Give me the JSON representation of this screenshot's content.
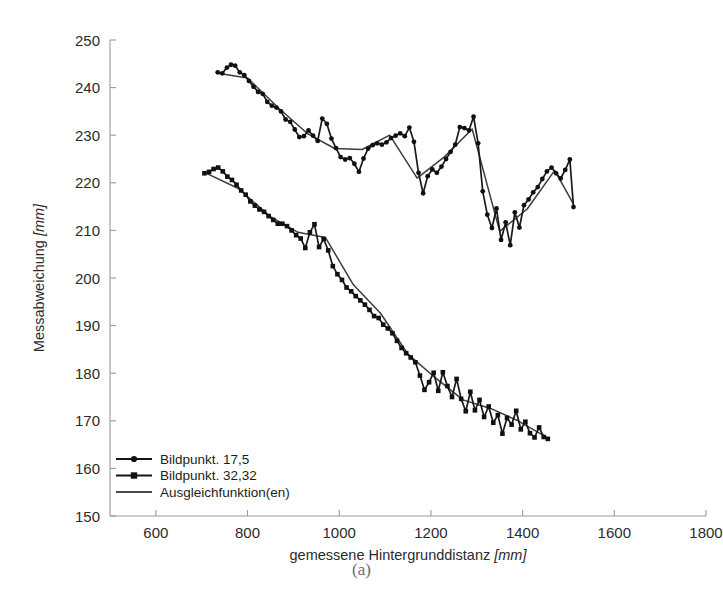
{
  "figure": {
    "caption": "(a)"
  },
  "chart_data": {
    "type": "line",
    "title": "",
    "xlabel_text": "gemessene Hintergrunddistanz ",
    "xlabel_unit": "[mm]",
    "ylabel_text": "Messabweichung ",
    "ylabel_unit": "[mm]",
    "xlim": [
      500,
      1800
    ],
    "ylim": [
      150,
      250
    ],
    "xticks": [
      600,
      800,
      1000,
      1200,
      1400,
      1600,
      1800
    ],
    "xticklabels": [
      "600",
      "800",
      "1000",
      "1200",
      "1400",
      "1600",
      "1800"
    ],
    "yticks": [
      150,
      160,
      170,
      180,
      190,
      200,
      210,
      220,
      230,
      240,
      250
    ],
    "yticklabels": [
      "150",
      "160",
      "170",
      "180",
      "190",
      "200",
      "210",
      "220",
      "230",
      "240",
      "250"
    ],
    "grid": false,
    "legend_position": "lower left",
    "legend": [
      {
        "label": "Bildpunkt. 17,5",
        "marker": "circle",
        "color": "#101010"
      },
      {
        "label": "Bildpunkt. 32,32",
        "marker": "square",
        "color": "#101010"
      },
      {
        "label": "Ausgleichfunktion(en)",
        "marker": "none",
        "color": "#4a4a4a"
      }
    ],
    "series": [
      {
        "name": "Bildpunkt. 17,5",
        "marker": "circle",
        "x": [
          735,
          745,
          755,
          764,
          773,
          783,
          793,
          803,
          813,
          823,
          833,
          843,
          853,
          863,
          873,
          883,
          893,
          903,
          913,
          923,
          933,
          943,
          953,
          963,
          973,
          983,
          993,
          1003,
          1013,
          1023,
          1033,
          1043,
          1053,
          1063,
          1073,
          1083,
          1093,
          1103,
          1113,
          1123,
          1133,
          1143,
          1153,
          1163,
          1173,
          1183,
          1193,
          1203,
          1213,
          1223,
          1233,
          1243,
          1253,
          1263,
          1273,
          1283,
          1293,
          1303,
          1313,
          1323,
          1333,
          1343,
          1353,
          1363,
          1373,
          1383,
          1393,
          1403,
          1413,
          1423,
          1433,
          1443,
          1453,
          1463,
          1473,
          1483,
          1493,
          1503,
          1511
        ],
        "y": [
          243.2,
          243.0,
          244.2,
          244.8,
          244.6,
          243.2,
          242.6,
          241.4,
          240.2,
          239.1,
          238.7,
          237.0,
          236.2,
          235.8,
          235.0,
          233.3,
          232.8,
          231.2,
          229.6,
          229.8,
          231.0,
          229.9,
          228.8,
          233.5,
          232.4,
          229.3,
          227.3,
          225.4,
          224.9,
          225.2,
          224.0,
          222.3,
          225.1,
          227.2,
          227.9,
          228.3,
          228.0,
          228.5,
          229.4,
          229.9,
          230.4,
          229.8,
          231.6,
          228.6,
          222.1,
          217.8,
          221.4,
          222.8,
          222.1,
          223.4,
          225.0,
          226.5,
          228.0,
          231.7,
          231.5,
          231.0,
          233.9,
          228.3,
          218.2,
          213.3,
          210.5,
          214.6,
          208.0,
          211.7,
          206.9,
          213.8,
          210.6,
          215.3,
          216.5,
          218.0,
          219.1,
          220.8,
          222.4,
          223.2,
          222.0,
          220.9,
          222.7,
          224.9,
          214.9
        ]
      },
      {
        "name": "Bildpunkt. 32,32",
        "marker": "square",
        "x": [
          706,
          716,
          726,
          736,
          746,
          756,
          766,
          776,
          786,
          796,
          806,
          816,
          826,
          836,
          846,
          856,
          866,
          876,
          886,
          896,
          906,
          916,
          926,
          936,
          946,
          956,
          966,
          976,
          986,
          996,
          1006,
          1016,
          1026,
          1036,
          1046,
          1056,
          1066,
          1076,
          1086,
          1096,
          1106,
          1116,
          1126,
          1136,
          1146,
          1156,
          1166,
          1176,
          1186,
          1196,
          1206,
          1216,
          1226,
          1236,
          1246,
          1256,
          1266,
          1276,
          1286,
          1296,
          1306,
          1316,
          1326,
          1336,
          1346,
          1356,
          1366,
          1376,
          1386,
          1396,
          1406,
          1416,
          1426,
          1436,
          1446,
          1455
        ],
        "y": [
          222.0,
          222.3,
          222.9,
          223.2,
          222.4,
          221.3,
          220.6,
          219.6,
          218.4,
          217.5,
          216.1,
          215.2,
          214.4,
          213.9,
          213.0,
          212.2,
          211.4,
          211.4,
          210.9,
          210.0,
          209.0,
          208.3,
          206.3,
          209.6,
          211.3,
          206.5,
          208.2,
          205.8,
          202.5,
          200.8,
          199.6,
          198.0,
          197.2,
          196.2,
          195.3,
          194.4,
          193.3,
          192.0,
          191.6,
          190.2,
          189.4,
          188.4,
          186.8,
          185.3,
          184.2,
          183.3,
          182.3,
          179.5,
          176.5,
          178.1,
          180.1,
          176.3,
          180.2,
          177.3,
          175.0,
          178.8,
          174.6,
          172.0,
          176.1,
          172.2,
          174.4,
          170.8,
          173.0,
          169.6,
          171.2,
          167.3,
          170.6,
          169.2,
          172.1,
          168.2,
          169.8,
          167.4,
          166.5,
          168.6,
          166.6,
          166.2
        ]
      }
    ],
    "fit_series": [
      {
        "name": "Ausgleichfunktion 17,5",
        "x": [
          735,
          800,
          870,
          930,
          990,
          1050,
          1110,
          1170,
          1230,
          1290,
          1350,
          1410,
          1470,
          1511
        ],
        "y": [
          243.0,
          242.0,
          235.5,
          230.4,
          227.2,
          227.0,
          230.0,
          221.0,
          225.5,
          231.3,
          209.8,
          214.5,
          222.6,
          215.5
        ]
      },
      {
        "name": "Ausgleichfunktion 32,32",
        "x": [
          706,
          780,
          850,
          910,
          970,
          1030,
          1090,
          1150,
          1210,
          1270,
          1330,
          1390,
          1455
        ],
        "y": [
          222.2,
          218.8,
          212.9,
          209.6,
          208.5,
          198.7,
          192.6,
          184.0,
          179.0,
          174.4,
          172.6,
          170.0,
          166.4
        ]
      }
    ]
  }
}
